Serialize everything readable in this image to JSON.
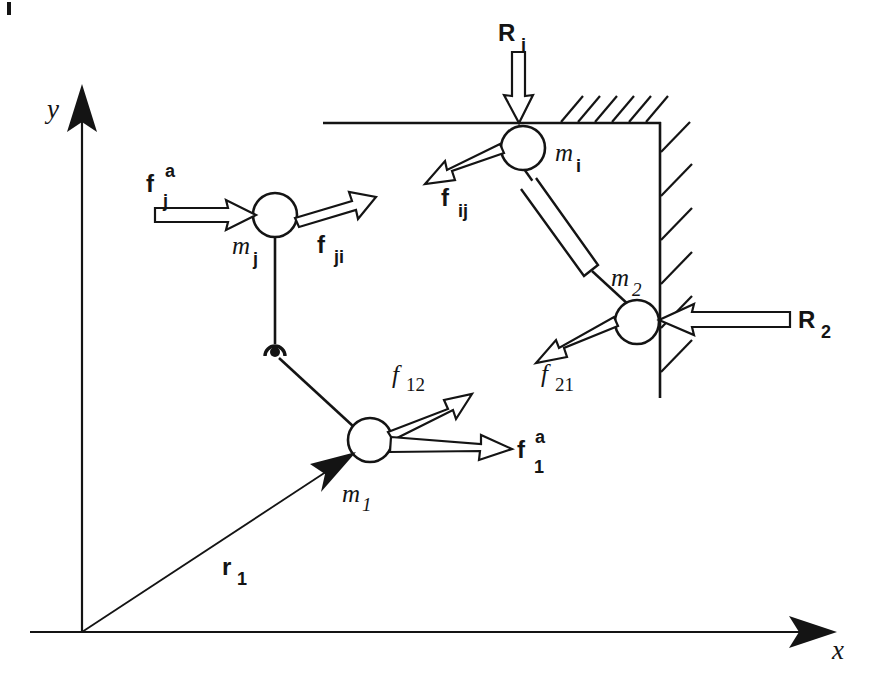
{
  "figure": {
    "kind": "free-body-diagram",
    "background_color": "#ffffff",
    "ink_color": "#141414"
  },
  "axes": {
    "origin": {
      "x": 82,
      "y": 632
    },
    "x_axis": {
      "label": "x",
      "label_x": 832,
      "label_y": 659,
      "tip_x": 837,
      "tip_y": 632,
      "start_x": 30,
      "start_y": 632
    },
    "y_axis": {
      "label": "y",
      "label_x": 47,
      "label_y": 118,
      "tip_x": 82,
      "tip_y": 84,
      "start_x": 82,
      "start_y": 632
    }
  },
  "masses": [
    {
      "name": "m1",
      "label": "m",
      "subscript": "1",
      "cx": 370,
      "cy": 440,
      "r": 22,
      "label_x": 342,
      "label_y": 502,
      "sub_x": 362,
      "sub_y": 510
    },
    {
      "name": "mj",
      "label": "m",
      "subscript": "j",
      "cx": 275,
      "cy": 215,
      "r": 22,
      "label_x": 236,
      "label_y": 254,
      "sub_x": 257,
      "sub_y": 264
    },
    {
      "name": "mi",
      "label": "m",
      "subscript": "i",
      "cx": 523,
      "cy": 148,
      "r": 22,
      "label_x": 556,
      "label_y": 160,
      "sub_x": 576,
      "sub_y": 170
    },
    {
      "name": "m2",
      "label": "m",
      "subscript": "2",
      "cx": 637,
      "cy": 322,
      "r": 22,
      "label_x": 613,
      "label_y": 285,
      "sub_x": 634,
      "sub_y": 294
    }
  ],
  "wall": {
    "corner": {
      "x": 660,
      "y": 123
    },
    "horizontal": {
      "x_start": 323,
      "x_end": 660,
      "y": 123,
      "hatch_x_start": 560
    },
    "vertical": {
      "x": 660,
      "y_start": 123,
      "y_end": 398
    },
    "hatch_count_top": 6,
    "hatch_count_right": 6
  },
  "pin_joint": {
    "cx": 275,
    "cy": 352,
    "r": 9,
    "dot_r": 5
  },
  "damper": {
    "from_x": 531,
    "from_y": 170,
    "to_x": 626,
    "to_y": 302,
    "body_label": "dashpot"
  },
  "forces": [
    {
      "name": "f_j_a",
      "base": "f",
      "subscript": "j",
      "superscript": "a",
      "style": "bold-vector",
      "label_x": 148,
      "label_y": 190,
      "sub_x": 167,
      "sub_y": 204,
      "sup_x": 167,
      "sup_y": 176,
      "tail_x": 155,
      "tail_y": 215,
      "tip_x": 254,
      "tip_y": 215
    },
    {
      "name": "f_ji",
      "base": "f",
      "subscript": "ji",
      "style": "bold-vector",
      "label_x": 319,
      "label_y": 252,
      "sub_x": 336,
      "sub_y": 262,
      "tail_x": 294,
      "tail_y": 207,
      "tip_x": 370,
      "tip_y": 185
    },
    {
      "name": "f_ij",
      "base": "f",
      "subscript": "ij",
      "style": "bold-vector",
      "label_x": 443,
      "label_y": 205,
      "sub_x": 459,
      "sub_y": 216,
      "tail_x": 503,
      "tail_y": 157,
      "tip_x": 428,
      "tip_y": 182
    },
    {
      "name": "f_12",
      "base": "f",
      "subscript": "12",
      "style": "italic-scalar",
      "label_x": 396,
      "label_y": 382,
      "sub_x": 409,
      "sub_y": 390,
      "tail_x": 389,
      "tail_y": 428,
      "tip_x": 468,
      "tip_y": 397
    },
    {
      "name": "f_1_a",
      "base": "f",
      "subscript": "1",
      "superscript": "a",
      "style": "bold-vector",
      "label_x": 519,
      "label_y": 455,
      "sub_x": 535,
      "sub_y": 470,
      "sup_x": 537,
      "sup_y": 441,
      "tail_x": 391,
      "tail_y": 443,
      "tip_x": 511,
      "tip_y": 448
    },
    {
      "name": "f_21",
      "base": "f",
      "subscript": "21",
      "style": "italic-scalar",
      "label_x": 545,
      "label_y": 381,
      "sub_x": 558,
      "sub_y": 390,
      "tail_x": 617,
      "tail_y": 331,
      "tip_x": 538,
      "tip_y": 362
    }
  ],
  "reactions": [
    {
      "name": "R_i",
      "base": "R",
      "subscript": "i",
      "label_x": 500,
      "label_y": 39,
      "sub_x": 521,
      "sub_y": 49,
      "tail_x": 517,
      "tail_y": 52,
      "tip_x": 519,
      "tip_y": 122
    },
    {
      "name": "R_2",
      "base": "R",
      "subscript": "2",
      "label_x": 800,
      "label_y": 326,
      "sub_x": 822,
      "sub_y": 336,
      "tail_x": 790,
      "tail_y": 318,
      "tip_x": 660,
      "tip_y": 320
    }
  ],
  "position_vector": {
    "name": "r_1",
    "base": "r",
    "subscript": "1",
    "label_x": 224,
    "label_y": 573,
    "sub_x": 238,
    "sub_y": 583,
    "tail_x": 82,
    "tail_y": 632,
    "tip_x": 354,
    "tip_y": 453
  },
  "links": [
    {
      "name": "link-mj-pin",
      "x1": 275,
      "y1": 237,
      "x2": 275,
      "y2": 345
    },
    {
      "name": "link-pin-m1",
      "x1": 280,
      "y1": 358,
      "x2": 353,
      "y2": 426
    },
    {
      "name": "link-mi-damper",
      "x1": 523,
      "y1": 170,
      "x2": 553,
      "y2": 214
    },
    {
      "name": "link-damper-m2",
      "x1": 600,
      "y1": 268,
      "x2": 630,
      "y2": 302
    }
  ],
  "scan_artifact": {
    "x": 7,
    "y": 2,
    "width": 4,
    "height": 13
  }
}
